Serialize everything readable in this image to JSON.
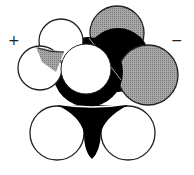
{
  "diagram": {
    "type": "space-filling molecular model",
    "charges": {
      "positive": "+",
      "negative": "−"
    },
    "atoms": [
      {
        "id": "h-top-left",
        "element": "H",
        "fill": "#ffffff"
      },
      {
        "id": "h-left",
        "element": "H",
        "fill": "#ffffff"
      },
      {
        "id": "n",
        "element": "N",
        "fill": "#b0b0b0"
      },
      {
        "id": "c-alpha",
        "element": "C",
        "fill": "#000000"
      },
      {
        "id": "h-center",
        "element": "H",
        "fill": "#ffffff"
      },
      {
        "id": "o-top",
        "element": "O",
        "fill": "#999999"
      },
      {
        "id": "c-carboxyl",
        "element": "C",
        "fill": "#000000"
      },
      {
        "id": "o-right",
        "element": "O",
        "fill": "#999999"
      },
      {
        "id": "c-bottom",
        "element": "C",
        "fill": "#000000"
      },
      {
        "id": "h-bottom-left",
        "element": "H",
        "fill": "#ffffff"
      },
      {
        "id": "h-bottom-right",
        "element": "H",
        "fill": "#ffffff"
      }
    ],
    "colors": {
      "carbon": "#000000",
      "hydrogen": "#ffffff",
      "oxygen": "#999999",
      "nitrogen": "#b0b0b0",
      "outline": "#222222"
    }
  }
}
